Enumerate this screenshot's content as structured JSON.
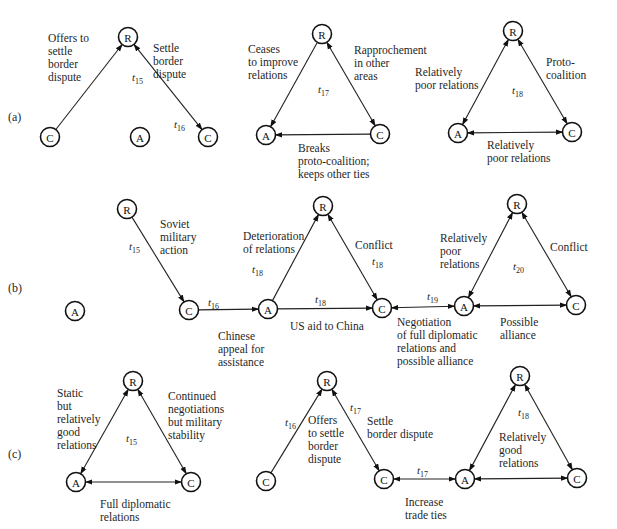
{
  "figure": {
    "rows": [
      {
        "label": "(a)",
        "panels": [
          {
            "id": "a1",
            "time": "15/16",
            "nodes": [
              {
                "id": "R",
                "label": "R"
              },
              {
                "id": "C",
                "label": "C"
              },
              {
                "id": "A",
                "label": "A"
              },
              {
                "id": "C2",
                "label": "C"
              }
            ],
            "edges": [
              {
                "from": "C",
                "to": "R",
                "arrows": "end",
                "time": "t",
                "sub": "15",
                "text": [
                  "Offers to",
                  "settle",
                  "border",
                  "dispute"
                ]
              },
              {
                "from": "R",
                "to": "C2",
                "arrows": "both",
                "time": "t",
                "sub": "16",
                "text": [
                  "Settle",
                  "border",
                  "dispute"
                ]
              }
            ]
          },
          {
            "id": "a2",
            "time": "t",
            "sub": "17",
            "nodes": [
              {
                "id": "R",
                "label": "R"
              },
              {
                "id": "A",
                "label": "A"
              },
              {
                "id": "C",
                "label": "C"
              }
            ],
            "edges": [
              {
                "from": "R",
                "to": "A",
                "arrows": "end",
                "text": [
                  "Ceases",
                  "to improve",
                  "relations"
                ]
              },
              {
                "from": "R",
                "to": "C",
                "arrows": "both",
                "text": [
                  "Rapprochement",
                  "in other",
                  "areas"
                ]
              },
              {
                "from": "C",
                "to": "A",
                "arrows": "end",
                "text": [
                  "Breaks",
                  "proto-coalition;",
                  "keeps other ties"
                ]
              }
            ]
          },
          {
            "id": "a3",
            "time": "t",
            "sub": "18",
            "nodes": [
              {
                "id": "R",
                "label": "R"
              },
              {
                "id": "A",
                "label": "A"
              },
              {
                "id": "C",
                "label": "C"
              }
            ],
            "edges": [
              {
                "from": "R",
                "to": "A",
                "arrows": "both",
                "text": [
                  "Relatively",
                  "poor relations"
                ]
              },
              {
                "from": "R",
                "to": "C",
                "arrows": "both",
                "text": [
                  "Proto-",
                  "coalition"
                ]
              },
              {
                "from": "A",
                "to": "C",
                "arrows": "both",
                "text": [
                  "Relatively",
                  "poor relations"
                ]
              }
            ]
          }
        ]
      },
      {
        "label": "(b)",
        "panels": [
          {
            "id": "b1",
            "nodes": [
              {
                "id": "R",
                "label": "R"
              },
              {
                "id": "A",
                "label": "A"
              },
              {
                "id": "C",
                "label": "C"
              }
            ],
            "edges": [
              {
                "from": "R",
                "to": "C",
                "arrows": "end",
                "time": "t",
                "sub": "15",
                "text": [
                  "Soviet",
                  "military",
                  "action"
                ]
              },
              {
                "from": "C",
                "to": "A2",
                "arrows": "end",
                "time": "t",
                "sub": "16",
                "text": [
                  "Chinese",
                  "appeal for",
                  "assistance"
                ]
              }
            ]
          },
          {
            "id": "b2",
            "nodes": [
              {
                "id": "A",
                "label": "A"
              },
              {
                "id": "R",
                "label": "R"
              },
              {
                "id": "C",
                "label": "C"
              }
            ],
            "edges": [
              {
                "from": "A",
                "to": "R",
                "arrows": "end",
                "time": "t",
                "sub": "18",
                "text": [
                  "Deterioration",
                  "of relations"
                ]
              },
              {
                "from": "R",
                "to": "C",
                "arrows": "both",
                "time": "t",
                "sub": "18",
                "text": [
                  "Conflict"
                ]
              },
              {
                "from": "A",
                "to": "C",
                "arrows": "end",
                "time": "t",
                "sub": "18",
                "text": [
                  "US aid to China"
                ]
              },
              {
                "from": "C",
                "to": "A3",
                "arrows": "both",
                "time": "t",
                "sub": "19",
                "text": [
                  "Negotiation",
                  "of full diplomatic",
                  "relations and",
                  "possible alliance"
                ]
              }
            ]
          },
          {
            "id": "b3",
            "time": "t",
            "sub": "20",
            "nodes": [
              {
                "id": "A",
                "label": "A"
              },
              {
                "id": "R",
                "label": "R"
              },
              {
                "id": "C",
                "label": "C"
              }
            ],
            "edges": [
              {
                "from": "A",
                "to": "R",
                "arrows": "both",
                "text": [
                  "Relatively",
                  "poor",
                  "relations"
                ]
              },
              {
                "from": "R",
                "to": "C",
                "arrows": "both",
                "text": [
                  "Conflict"
                ]
              },
              {
                "from": "A",
                "to": "C",
                "arrows": "both",
                "text": [
                  "Possible",
                  "alliance"
                ]
              }
            ]
          }
        ]
      },
      {
        "label": "(c)",
        "panels": [
          {
            "id": "c1",
            "time": "t",
            "sub": "15",
            "nodes": [
              {
                "id": "R",
                "label": "R"
              },
              {
                "id": "A",
                "label": "A"
              },
              {
                "id": "C",
                "label": "C"
              }
            ],
            "edges": [
              {
                "from": "A",
                "to": "R",
                "arrows": "both",
                "text": [
                  "Static",
                  "but",
                  "relatively",
                  "good",
                  "relations"
                ]
              },
              {
                "from": "R",
                "to": "C",
                "arrows": "both",
                "text": [
                  "Continued",
                  "negotiations",
                  "but military",
                  "stability"
                ]
              },
              {
                "from": "A",
                "to": "C",
                "arrows": "both",
                "text": [
                  "Full diplomatic",
                  "relations"
                ]
              }
            ]
          },
          {
            "id": "c2",
            "nodes": [
              {
                "id": "R",
                "label": "R"
              },
              {
                "id": "C",
                "label": "C"
              },
              {
                "id": "C2",
                "label": "C"
              }
            ],
            "edges": [
              {
                "from": "C",
                "to": "R",
                "arrows": "end",
                "time": "t",
                "sub": "16",
                "text": [
                  "Offers",
                  "to settle",
                  "border",
                  "dispute"
                ]
              },
              {
                "from": "R",
                "to": "C2",
                "arrows": "both",
                "time": "t",
                "sub": "17",
                "text": [
                  "Settle",
                  "border dispute"
                ]
              },
              {
                "from": "C2",
                "to": "A",
                "arrows": "both",
                "time": "t",
                "sub": "17",
                "text": [
                  "Increase",
                  "trade ties"
                ]
              }
            ]
          },
          {
            "id": "c3",
            "time": "t",
            "sub": "18",
            "nodes": [
              {
                "id": "A",
                "label": "A"
              },
              {
                "id": "R",
                "label": "R"
              },
              {
                "id": "C",
                "label": "C"
              }
            ],
            "edges": [
              {
                "from": "A",
                "to": "R",
                "arrows": "both"
              },
              {
                "from": "R",
                "to": "C",
                "arrows": "both"
              },
              {
                "from": "A",
                "to": "C",
                "arrows": "both"
              }
            ],
            "center_text": [
              "Relatively",
              "good",
              "relations"
            ]
          }
        ]
      }
    ]
  }
}
